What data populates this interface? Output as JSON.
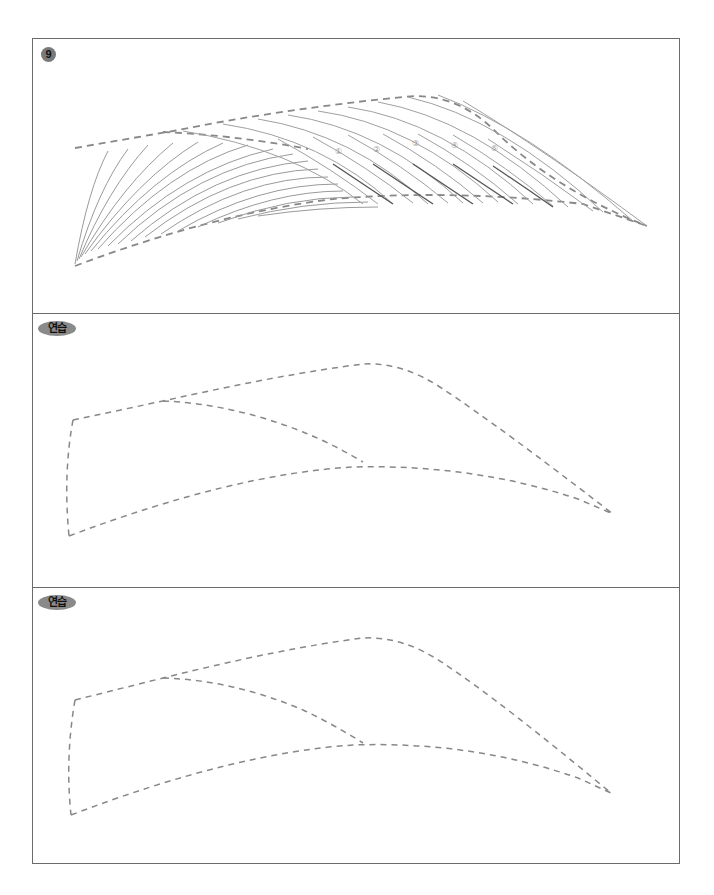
{
  "worksheet": {
    "example": {
      "step_number": "9",
      "stroke_labels": [
        "①",
        "②",
        "③",
        "④",
        "⑤"
      ]
    },
    "practice_panels": [
      {
        "label": "연습"
      },
      {
        "label": "연습"
      }
    ],
    "colors": {
      "border": "#6b6b6b",
      "guide_dash": "#888888",
      "hair_stroke": "#9a9a9a",
      "hair_stroke_dark": "#555555",
      "badge_fill": "#7a7a7a"
    }
  }
}
